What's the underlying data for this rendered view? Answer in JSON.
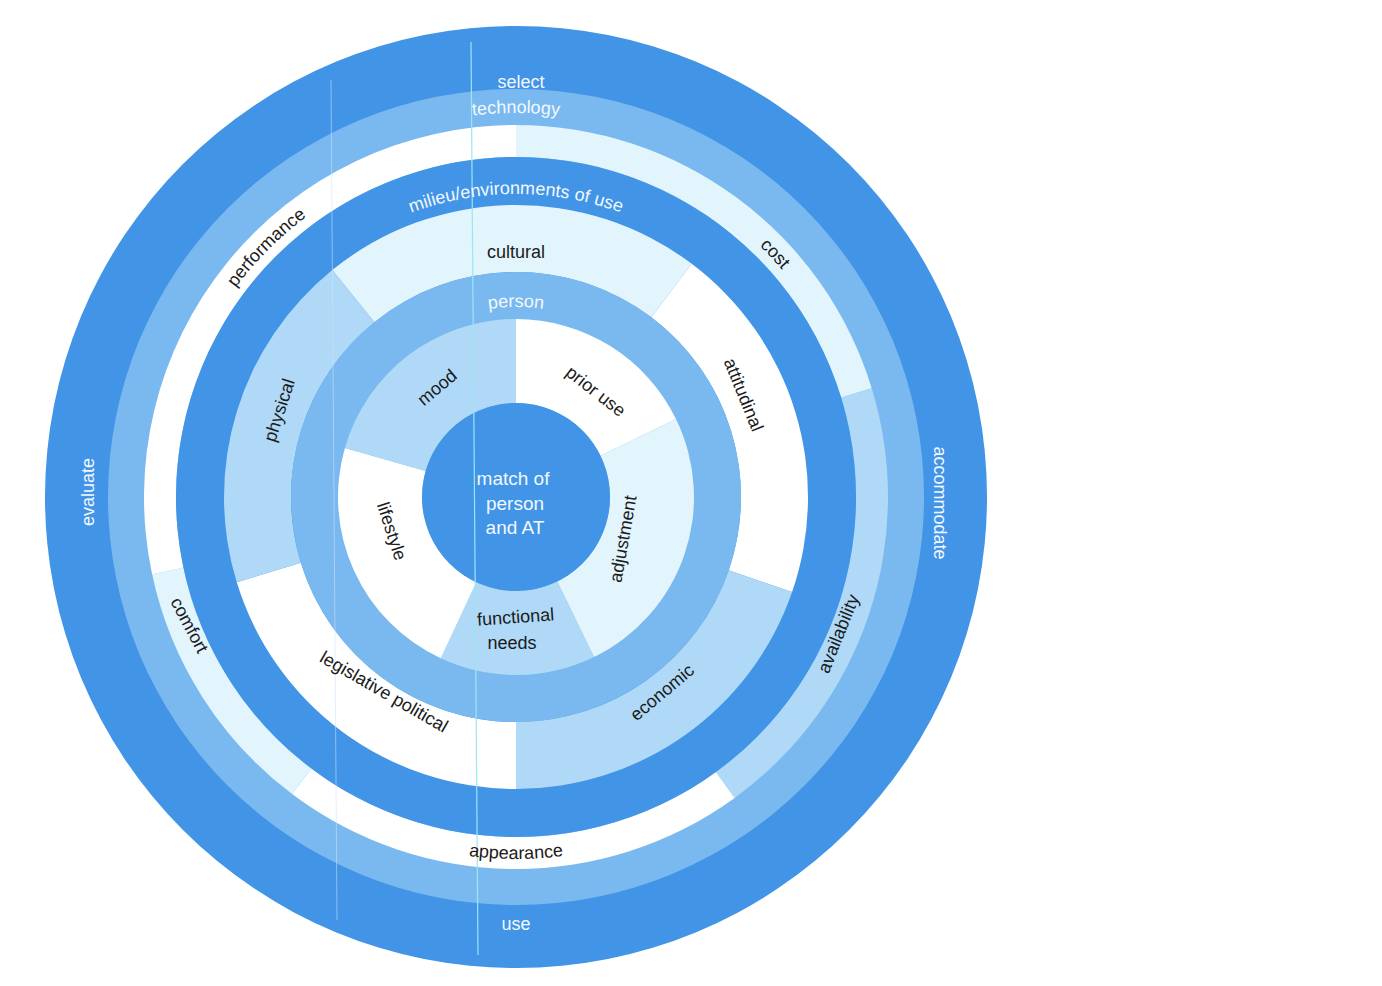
{
  "colors": {
    "dark_blue": "#4294e6",
    "medium_blue": "#7ab9ef",
    "light_blue": "#afd9f6",
    "light_cyan": "#e2f4fc",
    "white": "#ffffff",
    "scan_line": "#9ae6f5"
  },
  "geometry": {
    "cx": 516,
    "cy": 497,
    "r_outer": 471,
    "r_outer_inner": 408,
    "r_tech_band_inner": 372,
    "r_tech_sectors_inner": 340,
    "r_milieu_band_inner": 292,
    "r_milieu_sectors_inner": 225,
    "r_person_band_inner": 178,
    "r_center": 94
  },
  "outer_ring": {
    "labels": [
      {
        "text": "select",
        "position": "top"
      },
      {
        "text": "accommodate",
        "position": "right"
      },
      {
        "text": "use",
        "position": "bottom"
      },
      {
        "text": "evaluate",
        "position": "left"
      }
    ]
  },
  "technology": {
    "band_label": "technology",
    "sectors": [
      {
        "label": "cost",
        "start": 0,
        "end": 73,
        "fill": "#e2f4fc"
      },
      {
        "label": "availability",
        "start": 73,
        "end": 144,
        "fill": "#afd9f6"
      },
      {
        "label": "appearance",
        "start": 144,
        "end": 217,
        "fill": "#ffffff"
      },
      {
        "label": "comfort",
        "start": 217,
        "end": 258,
        "fill": "#e2f4fc"
      },
      {
        "label": "performance",
        "start": 258,
        "end": 360,
        "fill": "#ffffff"
      }
    ]
  },
  "milieu": {
    "band_label": "milieu/environments of use",
    "sectors": [
      {
        "label": "cultural",
        "start": -39,
        "end": 37,
        "fill": "#e2f4fc"
      },
      {
        "label": "attitudinal",
        "start": 37,
        "end": 109,
        "fill": "#ffffff"
      },
      {
        "label": "economic",
        "start": 109,
        "end": 180,
        "fill": "#afd9f6"
      },
      {
        "label": "legislative political",
        "start": 180,
        "end": 253,
        "fill": "#ffffff"
      },
      {
        "label": "physical",
        "start": 253,
        "end": 321,
        "fill": "#afd9f6"
      }
    ]
  },
  "person": {
    "band_label": "person",
    "sectors": [
      {
        "label": "prior use",
        "start": 0,
        "end": 64,
        "fill": "#ffffff"
      },
      {
        "label": "adjustment",
        "start": 64,
        "end": 154,
        "fill": "#e2f4fc"
      },
      {
        "label": "functional needs",
        "start": 154,
        "end": 205,
        "fill": "#afd9f6"
      },
      {
        "label": "lifestyle",
        "start": 205,
        "end": 286,
        "fill": "#ffffff"
      },
      {
        "label": "mood",
        "start": 286,
        "end": 360,
        "fill": "#afd9f6"
      }
    ]
  },
  "center": {
    "lines": [
      "match of",
      "person",
      "and AT"
    ]
  }
}
